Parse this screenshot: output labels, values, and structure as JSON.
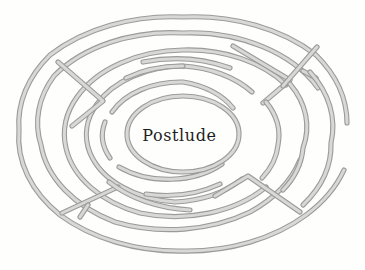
{
  "figure": {
    "kind": "labyrinth-maze-diagram",
    "center_label": "Postlude",
    "background_color": "#fefefd",
    "wall_stroke_color": "#9b9b9b",
    "wall_fill_color": "#d8d8d6",
    "wall_highlight_color": "#f2f2f0",
    "label_color": "#1d1d1d",
    "canvas": {
      "width": 365,
      "height": 270
    },
    "center": {
      "cx": 183,
      "cy": 134
    },
    "geometry": {
      "rings": [
        {
          "name": "ring-outer-1",
          "rx": 165,
          "ry": 117
        },
        {
          "name": "ring-2",
          "rx": 143,
          "ry": 101
        },
        {
          "name": "ring-3",
          "rx": 120,
          "ry": 84
        },
        {
          "name": "ring-4",
          "rx": 98,
          "ry": 68
        },
        {
          "name": "ring-5",
          "rx": 76,
          "ry": 52
        },
        {
          "name": "ring-center-chamber",
          "rx": 56,
          "ry": 38
        }
      ],
      "spokes": [
        {
          "name": "spoke-top-left",
          "angle_deg": 208
        },
        {
          "name": "spoke-bottom-right",
          "angle_deg": 28
        },
        {
          "name": "spoke-right-upper",
          "angle_deg": 330
        },
        {
          "name": "spoke-bottom-left",
          "angle_deg": 152
        }
      ],
      "gap_side": "right"
    }
  }
}
